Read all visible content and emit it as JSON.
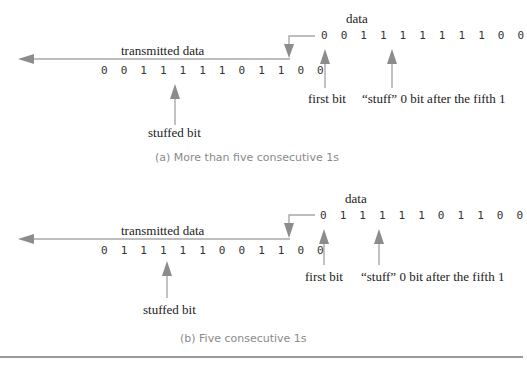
{
  "panels": [
    {
      "id": "a",
      "transmitted_label": "transmitted data",
      "transmitted_bits": "0 0 1 1 1 1 1 0 1 1 0 0",
      "data_label": "data",
      "data_bits": "0 0 1 1 1 1 1 1 1 0 0",
      "stuffed_label": "stuffed bit",
      "first_bit_label": "first bit",
      "stuff_note": "“stuff” 0 bit after the fifth 1",
      "caption": "(a) More than five consecutive 1s"
    },
    {
      "id": "b",
      "transmitted_label": "transmitted data",
      "transmitted_bits": "0 1 1 1 1 1 0 0 1 1 0 0",
      "data_label": "data",
      "data_bits": "0 1 1 1 1 1 0 1 1 0 0",
      "stuffed_label": "stuffed bit",
      "first_bit_label": "first bit",
      "stuff_note": "“stuff” 0 bit after the fifth 1",
      "caption": "(b) Five consecutive 1s"
    }
  ],
  "colors": {
    "arrow": "#8c8c8c",
    "line": "#a8a8a8",
    "caption": "#8a8a8a"
  }
}
